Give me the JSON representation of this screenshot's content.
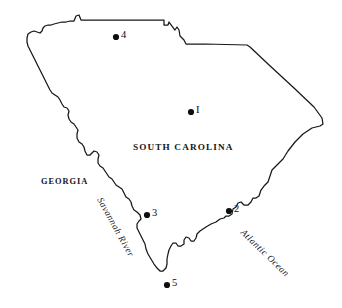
{
  "figure": {
    "subject": "South Carolina",
    "background_color": "#ffffff",
    "outline_color": "#15171a",
    "marker_color": "#0d0f11",
    "width": 342,
    "height": 308
  },
  "labels": {
    "state": "SOUTH CAROLINA",
    "neighbor_state": "GEORGIA",
    "river": "Savannah River",
    "ocean": "Atlantic Ocean"
  },
  "markers": [
    {
      "id": "1",
      "label": "I",
      "x": 191,
      "y": 112,
      "label_x": 196,
      "label_y": 105
    },
    {
      "id": "2",
      "label": "2",
      "x": 229,
      "y": 211,
      "label_x": 234,
      "label_y": 204
    },
    {
      "id": "3",
      "label": "3",
      "x": 147,
      "y": 215,
      "label_x": 152,
      "label_y": 208
    },
    {
      "id": "4",
      "label": "4",
      "x": 116,
      "y": 37,
      "label_x": 121,
      "label_y": 30
    },
    {
      "id": "5",
      "label": "5",
      "x": 167,
      "y": 285,
      "label_x": 172,
      "label_y": 278
    }
  ],
  "label_positions": {
    "state": {
      "x": 133,
      "y": 143
    },
    "neighbor_state": {
      "x": 41,
      "y": 178
    },
    "river": {
      "x": 103,
      "y": 196
    },
    "ocean": {
      "x": 245,
      "y": 228
    }
  }
}
